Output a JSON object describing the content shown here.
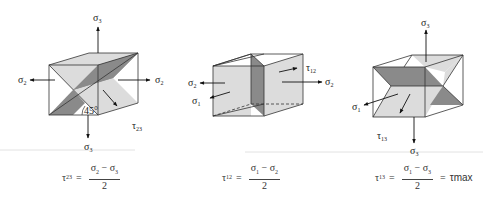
{
  "figure": {
    "colors": {
      "face_light": "#dcdcdc",
      "face_dark": "#8a8a8a",
      "edge": "#333333",
      "separator": "#e2e2e2"
    },
    "panels": [
      {
        "id": "tau23",
        "stress_labels": {
          "top": "σ",
          "top_sub": "3",
          "left": "σ",
          "left_sub": "2",
          "right": "σ",
          "right_sub": "2",
          "bottom": "σ",
          "bottom_sub": "3"
        },
        "shear_label": "τ",
        "shear_sub": "23",
        "angle_label": "45°",
        "equation": {
          "lhs": "τ",
          "lhs_sub": "23",
          "eq": "=",
          "num_a": "σ",
          "num_a_sub": "2",
          "minus": "−",
          "num_b": "σ",
          "num_b_sub": "3",
          "den": "2"
        }
      },
      {
        "id": "tau12",
        "stress_labels": {
          "left": "σ",
          "left_sub": "2",
          "front": "σ",
          "front_sub": "1",
          "right": "σ",
          "right_sub": "2"
        },
        "shear_label": "τ",
        "shear_sub": "12",
        "equation": {
          "lhs": "τ",
          "lhs_sub": "12",
          "eq": "=",
          "num_a": "σ",
          "num_a_sub": "1",
          "minus": "−",
          "num_b": "σ",
          "num_b_sub": "2",
          "den": "2"
        }
      },
      {
        "id": "tau13",
        "stress_labels": {
          "top": "σ",
          "top_sub": "3",
          "front": "σ",
          "front_sub": "1",
          "bottom": "σ",
          "bottom_sub": "3"
        },
        "shear_label": "τ",
        "shear_sub": "13",
        "equation": {
          "lhs": "τ",
          "lhs_sub": "13",
          "eq": "=",
          "num_a": "σ",
          "num_a_sub": "1",
          "minus": "−",
          "num_b": "σ",
          "num_b_sub": "3",
          "den": "2",
          "eq2": "=",
          "rhs": "τmax"
        }
      }
    ]
  }
}
